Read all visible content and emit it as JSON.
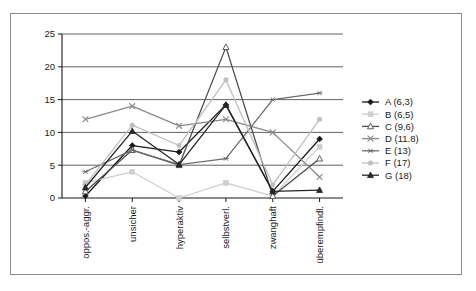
{
  "figure": {
    "border_color": "#8c8c8c",
    "background": "#ffffff"
  },
  "chart_data": {
    "type": "line",
    "title": "",
    "xlabel": "",
    "ylabel": "",
    "ylim": [
      0,
      25
    ],
    "yticks": [
      0,
      5,
      10,
      15,
      20,
      25
    ],
    "grid": true,
    "legend_position": "right",
    "categories": [
      "oppos.-aggr.",
      "unsicher",
      "hyperaktiv",
      "selbstverl.",
      "zwanghaft",
      "überempfindl."
    ],
    "series": [
      {
        "name": "A (6,3)",
        "color": "#1a1a1a",
        "marker": "diamond",
        "values": [
          0.3,
          8.0,
          7.0,
          14.2,
          1.0,
          9.0
        ]
      },
      {
        "name": "B (6,5)",
        "color": "#cfcfcf",
        "marker": "square",
        "values": [
          2.3,
          4.0,
          0.0,
          2.3,
          0.3,
          7.8
        ]
      },
      {
        "name": "C (9,6)",
        "color": "#4d4d4d",
        "marker": "triangle",
        "values": [
          1.0,
          7.3,
          5.0,
          23.0,
          0.3,
          6.0
        ]
      },
      {
        "name": "D (11.8)",
        "color": "#8a8a8a",
        "marker": "cross-x",
        "values": [
          12.0,
          14.0,
          11.0,
          12.0,
          10.0,
          3.2
        ]
      },
      {
        "name": "E (13)",
        "color": "#6b6b6b",
        "marker": "asterisk",
        "values": [
          4.0,
          7.3,
          5.1,
          6.0,
          15.0,
          16.0
        ]
      },
      {
        "name": "F (17)",
        "color": "#bfbfbf",
        "marker": "dot",
        "values": [
          2.0,
          11.1,
          8.0,
          18.0,
          2.0,
          12.0
        ]
      },
      {
        "name": "G (18)",
        "color": "#262626",
        "marker": "triangle-filled",
        "values": [
          1.6,
          10.2,
          5.1,
          14.2,
          1.0,
          1.2
        ]
      }
    ]
  }
}
